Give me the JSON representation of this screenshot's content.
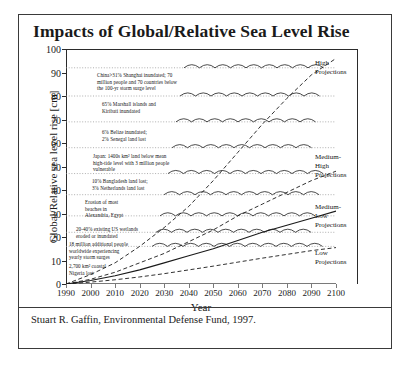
{
  "title": "Impacts of Global/Relative Sea Level Rise",
  "credit": "Stuart R. Gaffin, Environmental Defense Fund, 1997.",
  "axes": {
    "ylabel": "Global/Relative sea level rise [cm]",
    "xlabel": "Year",
    "yticks": [
      0,
      10,
      20,
      30,
      40,
      50,
      60,
      70,
      80,
      90,
      100
    ],
    "xticks": [
      1990,
      2000,
      2010,
      2020,
      2030,
      2040,
      2050,
      2060,
      2070,
      2080,
      2090,
      2100
    ]
  },
  "projection_labels": [
    {
      "text": "High\nProjections"
    },
    {
      "text": "Medium-\nHigh\nProjections"
    },
    {
      "text": "Medium-\nLow\nProjections"
    },
    {
      "text": "Low\nProjections"
    }
  ],
  "impacts": [
    {
      "text": "China>31% Shanghai inundated; 70\nmillion people and 70 countries below\nthe 100-yr storm surge level"
    },
    {
      "text": "65% Marshall islands and\nKiribati inundated"
    },
    {
      "text": "6% Belize inundated;\n2% Senegal land lost"
    },
    {
      "text": "Japan: 1400s km² land below mean\nhigh-tide level with 3 million people\nvulnerable"
    },
    {
      "text": "10% Bangladesh land lost;\n3% Netherlands land lost"
    },
    {
      "text": "Erosion of most\nbeaches in\nAlexandria, Egypt"
    },
    {
      "text": "20-40% existing US wetlands\neroded or inundated"
    },
    {
      "text": "18 million additional people\nworldwide experiencing\nyearly storm surges"
    },
    {
      "text": "2,700 km² coastal\nNigeria lost"
    }
  ],
  "chart_data": {
    "type": "line",
    "title": "Impacts of Global/Relative Sea Level Rise",
    "xlabel": "Year",
    "ylabel": "Global/Relative sea level rise [cm]",
    "xlim": [
      1990,
      2100
    ],
    "ylim": [
      0,
      100
    ],
    "grid": false,
    "legend_position": "right",
    "x": [
      1990,
      2000,
      2010,
      2020,
      2030,
      2040,
      2050,
      2060,
      2070,
      2080,
      2090,
      2100
    ],
    "series": [
      {
        "name": "High Projections",
        "style": "dashed",
        "values": [
          0,
          4,
          9,
          16,
          24,
          33,
          44,
          56,
          68,
          79,
          89,
          96
        ]
      },
      {
        "name": "Medium-High Projections",
        "style": "dashed",
        "values": [
          0,
          2,
          5,
          9,
          13,
          18,
          23,
          29,
          34,
          39,
          44,
          48
        ]
      },
      {
        "name": "Medium-Low Projections",
        "style": "solid",
        "values": [
          0,
          1.5,
          3.5,
          6,
          9,
          12,
          15,
          18.5,
          22,
          25,
          28,
          31
        ]
      },
      {
        "name": "Low Projections",
        "style": "dashed",
        "values": [
          0,
          0.8,
          1.8,
          3,
          4.4,
          6,
          7.6,
          9.3,
          11,
          12.6,
          14.2,
          15.5
        ]
      }
    ],
    "impact_thresholds": [
      {
        "level_cm": 92,
        "label": "China>31% Shanghai inundated; 70 million people and 70 countries below the 100-yr storm surge level"
      },
      {
        "level_cm": 80,
        "label": "65% Marshall islands and Kiribati inundated"
      },
      {
        "level_cm": 69,
        "label": "6% Belize inundated; 2% Senegal land lost"
      },
      {
        "level_cm": 58,
        "label": "Japan: 1400s km² land below mean high-tide level with 3 million people vulnerable"
      },
      {
        "level_cm": 47,
        "label": "10% Bangladesh land lost; 3% Netherlands land lost"
      },
      {
        "level_cm": 38,
        "label": "Erosion of most beaches in Alexandria, Egypt"
      },
      {
        "level_cm": 29,
        "label": "20-40% existing US wetlands eroded or inundated"
      },
      {
        "level_cm": 22,
        "label": "18 million additional people worldwide experiencing yearly storm surges"
      },
      {
        "level_cm": 16,
        "label": "2,700 km² coastal Nigeria lost"
      }
    ]
  }
}
